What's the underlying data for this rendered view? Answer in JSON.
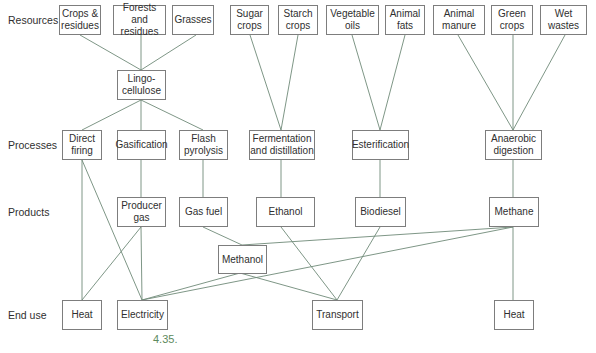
{
  "row_labels": {
    "resources": "Resources",
    "processes": "Processes",
    "products": "Products",
    "end_use": "End use"
  },
  "resources": {
    "crops_residues": "Crops &\nresidues",
    "forests_residues": "Forests and\nresidues",
    "grasses": "Grasses",
    "sugar_crops": "Sugar\ncrops",
    "starch_crops": "Starch\ncrops",
    "vegetable_oils": "Vegetable\noils",
    "animal_fats": "Animal\nfats",
    "animal_manure": "Animal\nmanure",
    "green_crops": "Green\ncrops",
    "wet_wastes": "Wet\nwastes"
  },
  "intermediate": {
    "lingocellulose": "Lingo-\ncellulose"
  },
  "processes": {
    "direct_firing": "Direct\nfiring",
    "gasification": "Gasification",
    "flash_pyrolysis": "Flash\npyrolysis",
    "fermentation": "Fermentation\nand distillation",
    "esterification": "Esterification",
    "anaerobic": "Anaerobic\ndigestion"
  },
  "products": {
    "producer_gas": "Producer\ngas",
    "gas_fuel": "Gas fuel",
    "ethanol": "Ethanol",
    "biodiesel": "Biodiesel",
    "methane": "Methane",
    "methanol": "Methanol"
  },
  "end_use": {
    "heat_left": "Heat",
    "electricity": "Electricity",
    "transport": "Transport",
    "heat_right": "Heat"
  },
  "figure_label": "4.35.",
  "colors": {
    "line": "#6f8a78",
    "box_border": "#7d7d7d",
    "figure_label": "#5d8a5d"
  }
}
